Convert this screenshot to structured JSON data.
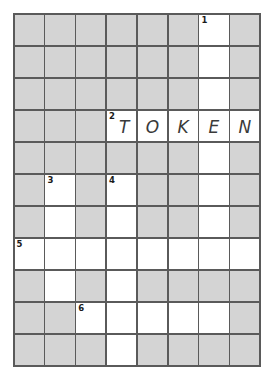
{
  "puzzle": {
    "type": "crossword-grid",
    "columns": 8,
    "rows": 11,
    "colors": {
      "blocked_cell": "#d4d4d4",
      "open_cell": "#ffffff",
      "grid_line": "#5a5a5a",
      "letter_text": "#3a3a3a",
      "number_text": "#1a1a1a",
      "page_background": "#ffffff"
    },
    "answer_shown": "TOKEN",
    "clue_numbers": [
      "1",
      "2",
      "3",
      "4",
      "5",
      "6"
    ],
    "cells": [
      [
        {
          "state": "blocked",
          "number": "",
          "letter": ""
        },
        {
          "state": "blocked",
          "number": "",
          "letter": ""
        },
        {
          "state": "blocked",
          "number": "",
          "letter": ""
        },
        {
          "state": "blocked",
          "number": "",
          "letter": ""
        },
        {
          "state": "blocked",
          "number": "",
          "letter": ""
        },
        {
          "state": "blocked",
          "number": "",
          "letter": ""
        },
        {
          "state": "open",
          "number": "1",
          "letter": ""
        },
        {
          "state": "blocked",
          "number": "",
          "letter": ""
        }
      ],
      [
        {
          "state": "blocked",
          "number": "",
          "letter": ""
        },
        {
          "state": "blocked",
          "number": "",
          "letter": ""
        },
        {
          "state": "blocked",
          "number": "",
          "letter": ""
        },
        {
          "state": "blocked",
          "number": "",
          "letter": ""
        },
        {
          "state": "blocked",
          "number": "",
          "letter": ""
        },
        {
          "state": "blocked",
          "number": "",
          "letter": ""
        },
        {
          "state": "open",
          "number": "",
          "letter": ""
        },
        {
          "state": "blocked",
          "number": "",
          "letter": ""
        }
      ],
      [
        {
          "state": "blocked",
          "number": "",
          "letter": ""
        },
        {
          "state": "blocked",
          "number": "",
          "letter": ""
        },
        {
          "state": "blocked",
          "number": "",
          "letter": ""
        },
        {
          "state": "blocked",
          "number": "",
          "letter": ""
        },
        {
          "state": "blocked",
          "number": "",
          "letter": ""
        },
        {
          "state": "blocked",
          "number": "",
          "letter": ""
        },
        {
          "state": "open",
          "number": "",
          "letter": ""
        },
        {
          "state": "blocked",
          "number": "",
          "letter": ""
        }
      ],
      [
        {
          "state": "blocked",
          "number": "",
          "letter": ""
        },
        {
          "state": "blocked",
          "number": "",
          "letter": ""
        },
        {
          "state": "blocked",
          "number": "",
          "letter": ""
        },
        {
          "state": "open",
          "number": "2",
          "letter": "T"
        },
        {
          "state": "open",
          "number": "",
          "letter": "O"
        },
        {
          "state": "open",
          "number": "",
          "letter": "K"
        },
        {
          "state": "open",
          "number": "",
          "letter": "E"
        },
        {
          "state": "open",
          "number": "",
          "letter": "N"
        }
      ],
      [
        {
          "state": "blocked",
          "number": "",
          "letter": ""
        },
        {
          "state": "blocked",
          "number": "",
          "letter": ""
        },
        {
          "state": "blocked",
          "number": "",
          "letter": ""
        },
        {
          "state": "blocked",
          "number": "",
          "letter": ""
        },
        {
          "state": "blocked",
          "number": "",
          "letter": ""
        },
        {
          "state": "blocked",
          "number": "",
          "letter": ""
        },
        {
          "state": "open",
          "number": "",
          "letter": ""
        },
        {
          "state": "blocked",
          "number": "",
          "letter": ""
        }
      ],
      [
        {
          "state": "blocked",
          "number": "",
          "letter": ""
        },
        {
          "state": "open",
          "number": "3",
          "letter": ""
        },
        {
          "state": "blocked",
          "number": "",
          "letter": ""
        },
        {
          "state": "open",
          "number": "4",
          "letter": ""
        },
        {
          "state": "blocked",
          "number": "",
          "letter": ""
        },
        {
          "state": "blocked",
          "number": "",
          "letter": ""
        },
        {
          "state": "open",
          "number": "",
          "letter": ""
        },
        {
          "state": "blocked",
          "number": "",
          "letter": ""
        }
      ],
      [
        {
          "state": "blocked",
          "number": "",
          "letter": ""
        },
        {
          "state": "open",
          "number": "",
          "letter": ""
        },
        {
          "state": "blocked",
          "number": "",
          "letter": ""
        },
        {
          "state": "open",
          "number": "",
          "letter": ""
        },
        {
          "state": "blocked",
          "number": "",
          "letter": ""
        },
        {
          "state": "blocked",
          "number": "",
          "letter": ""
        },
        {
          "state": "open",
          "number": "",
          "letter": ""
        },
        {
          "state": "blocked",
          "number": "",
          "letter": ""
        }
      ],
      [
        {
          "state": "open",
          "number": "5",
          "letter": ""
        },
        {
          "state": "open",
          "number": "",
          "letter": ""
        },
        {
          "state": "open",
          "number": "",
          "letter": ""
        },
        {
          "state": "open",
          "number": "",
          "letter": ""
        },
        {
          "state": "open",
          "number": "",
          "letter": ""
        },
        {
          "state": "open",
          "number": "",
          "letter": ""
        },
        {
          "state": "open",
          "number": "",
          "letter": ""
        },
        {
          "state": "open",
          "number": "",
          "letter": ""
        }
      ],
      [
        {
          "state": "blocked",
          "number": "",
          "letter": ""
        },
        {
          "state": "open",
          "number": "",
          "letter": ""
        },
        {
          "state": "blocked",
          "number": "",
          "letter": ""
        },
        {
          "state": "open",
          "number": "",
          "letter": ""
        },
        {
          "state": "blocked",
          "number": "",
          "letter": ""
        },
        {
          "state": "blocked",
          "number": "",
          "letter": ""
        },
        {
          "state": "blocked",
          "number": "",
          "letter": ""
        },
        {
          "state": "blocked",
          "number": "",
          "letter": ""
        }
      ],
      [
        {
          "state": "blocked",
          "number": "",
          "letter": ""
        },
        {
          "state": "blocked",
          "number": "",
          "letter": ""
        },
        {
          "state": "open",
          "number": "6",
          "letter": ""
        },
        {
          "state": "open",
          "number": "",
          "letter": ""
        },
        {
          "state": "open",
          "number": "",
          "letter": ""
        },
        {
          "state": "open",
          "number": "",
          "letter": ""
        },
        {
          "state": "open",
          "number": "",
          "letter": ""
        },
        {
          "state": "blocked",
          "number": "",
          "letter": ""
        }
      ],
      [
        {
          "state": "blocked",
          "number": "",
          "letter": ""
        },
        {
          "state": "blocked",
          "number": "",
          "letter": ""
        },
        {
          "state": "blocked",
          "number": "",
          "letter": ""
        },
        {
          "state": "open",
          "number": "",
          "letter": ""
        },
        {
          "state": "blocked",
          "number": "",
          "letter": ""
        },
        {
          "state": "blocked",
          "number": "",
          "letter": ""
        },
        {
          "state": "blocked",
          "number": "",
          "letter": ""
        },
        {
          "state": "blocked",
          "number": "",
          "letter": ""
        }
      ]
    ]
  }
}
